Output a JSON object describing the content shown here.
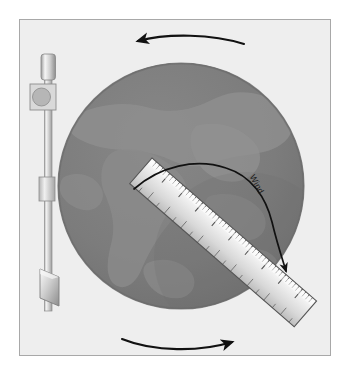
{
  "figure": {
    "type": "schematic-illustration",
    "width": 351,
    "height": 376,
    "background_color": "#ffffff"
  },
  "panel": {
    "name": "illustration-panel",
    "fill_color": "#eeeeee",
    "border_color": "#a8a8a8",
    "x": 19,
    "y": 19,
    "width": 312,
    "height": 337
  },
  "globe": {
    "label": "globe",
    "center_x": 181,
    "center_y": 186,
    "radius": 123,
    "ocean_color": "#7a7a7a",
    "land_color": "#8c8c8c",
    "rim_color": "#6e6e6e",
    "shadow_color": "#6a6a6a"
  },
  "rotation_arrows": [
    {
      "name": "rotation-arrow-top",
      "direction": "left",
      "position": "above-globe"
    },
    {
      "name": "rotation-arrow-bottom",
      "direction": "right",
      "position": "below-globe"
    }
  ],
  "rod_assembly": {
    "name": "support-rod-assembly",
    "rod_color": "#d4d4d4",
    "rod_edge_color": "#9a9a9a",
    "parts": [
      {
        "name": "rod-top-cap",
        "shape": "cylinder"
      },
      {
        "name": "pivot-bracket",
        "shape": "square"
      },
      {
        "name": "pivot-wheel",
        "shape": "circle"
      },
      {
        "name": "rod-shaft",
        "shape": "vertical-bar"
      },
      {
        "name": "mid-collar",
        "shape": "rectangle"
      },
      {
        "name": "bottom-vane",
        "shape": "parallelogram"
      }
    ]
  },
  "ruler": {
    "name": "ruler",
    "angle_degrees": 41,
    "body_color": "#e3e3e3",
    "edge_color": "#5a5a5a",
    "tick_color": "#4a4a4a",
    "major_tick_count": 9,
    "minor_ticks_per_major": 4
  },
  "wind": {
    "label": "Wind",
    "label_rotation_degrees": 62,
    "arrow_color": "#111111",
    "arrow_description": "curved arrow arcing from left over the top, bending down to terminate on the ruler"
  },
  "colors": {
    "ink": "#111111",
    "panel_fill": "#eeeeee",
    "panel_border": "#a8a8a8",
    "globe_ocean": "#7a7a7a",
    "globe_land": "#8c8c8c",
    "metal_light": "#f2f2f2",
    "metal_mid": "#c9c9c9",
    "metal_dark": "#8f8f8f"
  }
}
